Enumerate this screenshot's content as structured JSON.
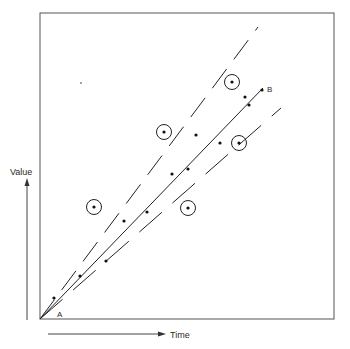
{
  "chart_data": {
    "type": "scatter",
    "title": "",
    "xlabel": "Time",
    "ylabel": "Value",
    "grid": false,
    "legend": null,
    "annotations": [
      {
        "text": "A",
        "role": "origin / start point"
      },
      {
        "text": "B",
        "role": "end point of fitted trend line"
      }
    ],
    "frame_px": {
      "left": 40,
      "top": 13,
      "right": 334,
      "bottom": 319
    },
    "origin_px": [
      40,
      319
    ],
    "lines": [
      {
        "name": "upper-bound",
        "style": "dashed",
        "from_px": [
          40,
          319
        ],
        "to_px": [
          258,
          27
        ]
      },
      {
        "name": "trend-A-to-B",
        "style": "solid",
        "from_px": [
          40,
          319
        ],
        "to_px": [
          263,
          88
        ]
      },
      {
        "name": "lower-bound",
        "style": "long-dash",
        "from_px": [
          40,
          319
        ],
        "to_px": [
          281,
          108
        ]
      }
    ],
    "points_px": [
      [
        54,
        298
      ],
      [
        80,
        276
      ],
      [
        106,
        261
      ],
      [
        124,
        221
      ],
      [
        147,
        212
      ],
      [
        172,
        174
      ],
      [
        188,
        169
      ],
      [
        196,
        135
      ],
      [
        220,
        143
      ],
      [
        245,
        97
      ],
      [
        249,
        105
      ],
      [
        262,
        90
      ]
    ],
    "circled_points_px": [
      [
        94,
        207
      ],
      [
        164,
        132
      ],
      [
        232,
        82
      ],
      [
        188,
        208
      ],
      [
        239,
        143
      ]
    ],
    "stray_mark_px": [
      81,
      83
    ]
  },
  "labels": {
    "value": "Value",
    "time": "Time",
    "a": "A",
    "b": "B"
  }
}
